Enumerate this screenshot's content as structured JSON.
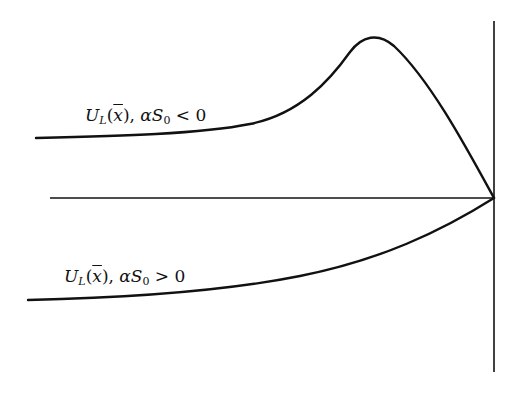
{
  "figure": {
    "type": "schematic-potential-diagram",
    "labels": {
      "upper_curve": {
        "func": "U",
        "func_sub": "L",
        "arg": "x",
        "sep": ", ",
        "param": "α",
        "param2": "S",
        "param2_sub": "0",
        "relation": " < 0"
      },
      "lower_curve": {
        "func": "U",
        "func_sub": "L",
        "arg": "x",
        "sep": ", ",
        "param": "α",
        "param2": "S",
        "param2_sub": "0",
        "relation": " > 0"
      }
    },
    "geometry": {
      "vertical_axis": {
        "x": 494,
        "y1": 21,
        "y2": 372
      },
      "horizontal_axis": {
        "y": 198,
        "x1": 50,
        "x2": 494
      },
      "upper_curve_path": "M36,138 C120,136 200,134 250,124 C300,114 330,80 350,52 C362,36 378,32 394,46 C430,80 465,145 494,198",
      "lower_curve_path": "M28,300 C120,298 220,292 300,276 C380,260 440,232 494,198"
    },
    "colors": {
      "line": "#111111",
      "background": "#ffffff"
    }
  }
}
